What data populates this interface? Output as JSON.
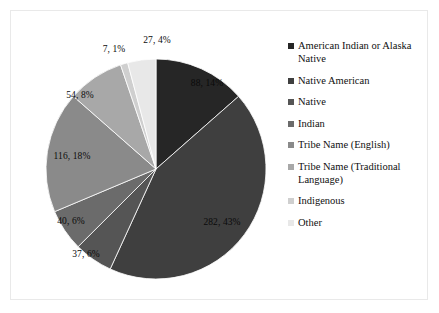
{
  "chart_data": {
    "type": "pie",
    "title": "",
    "subtitle": "",
    "xlabel": "",
    "ylabel": "",
    "legend_position": "right",
    "grid": false,
    "start_angle_deg": 0,
    "direction": "clockwise",
    "total": 651,
    "categories": [
      "American Indian or Alaska Native",
      "Native American",
      "Native",
      "Indian",
      "Tribe Name (English)",
      "Tribe Name (Traditional Language)",
      "Indigenous",
      "Other"
    ],
    "values": [
      88,
      282,
      37,
      40,
      116,
      54,
      7,
      27
    ],
    "percents": [
      14,
      43,
      6,
      6,
      18,
      8,
      1,
      4
    ],
    "data_labels": [
      "88, 14%",
      "282, 43%",
      "37, 6%",
      "40, 6%",
      "116, 18%",
      "54, 8%",
      "7, 1%",
      "27, 4%"
    ],
    "colors": [
      "#262626",
      "#3f3f3f",
      "#555555",
      "#6b6b6b",
      "#8a8a8a",
      "#a8a8a8",
      "#cfcfcf",
      "#e8e8e8"
    ],
    "label_positions": [
      {
        "x": 196,
        "y": 72,
        "on_dark": true
      },
      {
        "x": 211,
        "y": 211,
        "on_dark": true
      },
      {
        "x": 75,
        "y": 243,
        "on_dark": true
      },
      {
        "x": 60,
        "y": 210,
        "on_dark": true
      },
      {
        "x": 61,
        "y": 145,
        "on_dark": false
      },
      {
        "x": 69,
        "y": 84,
        "on_dark": false
      },
      {
        "x": 103,
        "y": 38,
        "on_dark": false
      },
      {
        "x": 146,
        "y": 29,
        "on_dark": false
      }
    ]
  },
  "legend": {
    "items": [
      {
        "label": "American Indian or Alaska Native",
        "color": "#262626"
      },
      {
        "label": "Native American",
        "color": "#3f3f3f"
      },
      {
        "label": "Native",
        "color": "#555555"
      },
      {
        "label": "Indian",
        "color": "#6b6b6b"
      },
      {
        "label": "Tribe Name (English)",
        "color": "#8a8a8a"
      },
      {
        "label": "Tribe Name (Traditional Language)",
        "color": "#a8a8a8"
      },
      {
        "label": "Indigenous",
        "color": "#cfcfcf"
      },
      {
        "label": "Other",
        "color": "#e8e8e8"
      }
    ]
  }
}
